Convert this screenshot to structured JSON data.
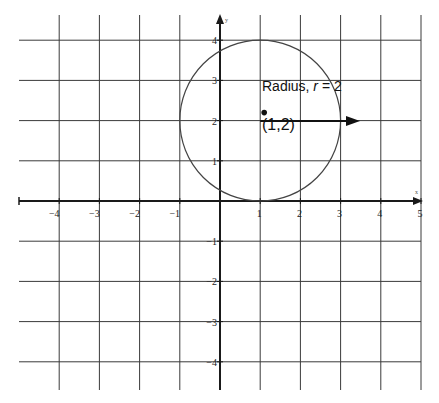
{
  "diagram": {
    "type": "coordinate-plane-circle",
    "colors": {
      "grid": "#3a3a3a",
      "axis": "#1a1a1a",
      "circle": "#444444",
      "text": "#111111",
      "background": "#ffffff"
    },
    "x_axis": {
      "label": "x",
      "range": [
        -5,
        5
      ],
      "ticks": [
        -4,
        -3,
        -2,
        -1,
        1,
        2,
        3,
        4,
        5
      ]
    },
    "y_axis": {
      "label": "y",
      "range": [
        -5,
        5
      ],
      "ticks": [
        4,
        3,
        2,
        1,
        -1,
        -2,
        -3,
        -4
      ]
    },
    "tick_labels_x": [
      "−4",
      "−3",
      "−2",
      "−1",
      "1",
      "2",
      "3",
      "4",
      "5"
    ],
    "tick_labels_y": [
      "4",
      "3",
      "2",
      "1",
      "−1",
      "−2",
      "−3",
      "−4"
    ],
    "circle": {
      "center": [
        1,
        2
      ],
      "radius": 2
    },
    "center_label": "(1,2)",
    "radius_label_prefix": "Radius, ",
    "radius_label_var": "r",
    "radius_label_suffix": " = 2"
  },
  "chart_data": {
    "type": "scatter",
    "title": "",
    "xlabel": "x",
    "ylabel": "y",
    "xlim": [
      -5,
      5
    ],
    "ylim": [
      -4.5,
      4.5
    ],
    "grid": true,
    "series": [
      {
        "name": "circle",
        "shape": "circle",
        "center": [
          1,
          2
        ],
        "radius": 2
      },
      {
        "name": "center",
        "x": [
          1
        ],
        "y": [
          2
        ]
      }
    ],
    "annotations": [
      "Radius, r = 2",
      "(1,2)"
    ]
  }
}
